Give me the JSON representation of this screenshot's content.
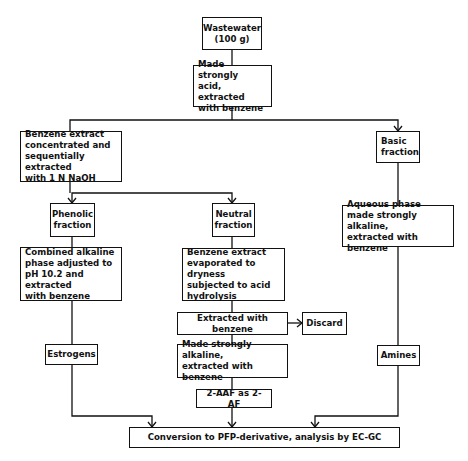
{
  "diagram": {
    "type": "flowchart",
    "nodes": {
      "wastewater": "Wastewater\n(100 g)",
      "acidify": "  Made strongly\nacid, extracted\nwith benzene",
      "benzene_extract": "   Benzene extract\nconcentrated and\nsequentially extracted\nwith 1 N NaOH",
      "basic": "Basic\nfraction",
      "phenolic": "Phenolic\nfraction",
      "neutral": "Neutral\nfraction",
      "combined_alkaline": "   Combined alkaline\nphase adjusted to\npH 10.2 and extracted\nwith benzene",
      "benzene_evaporated": "   Benzene extract\nevaporated to dryness\nsubjected to acid\nhydrolysis",
      "aqueous": "   Aqueous phase\nmade strongly alkaline,\nextracted with benzene",
      "extracted_benzene": "Extracted with benzene",
      "discard": "Discard",
      "made_alkaline": "   Made strongly alkaline,\nextracted with benzene",
      "estrogens": "Estrogens",
      "aaf": "2-AAF as 2-AF",
      "amines": "Amines",
      "conversion": "Conversion to PFP-derivative, analysis by EC-GC"
    },
    "edges": [
      [
        "wastewater",
        "acidify"
      ],
      [
        "acidify",
        "benzene_extract"
      ],
      [
        "acidify",
        "basic"
      ],
      [
        "benzene_extract",
        "phenolic"
      ],
      [
        "benzene_extract",
        "neutral"
      ],
      [
        "phenolic",
        "combined_alkaline"
      ],
      [
        "neutral",
        "benzene_evaporated"
      ],
      [
        "basic",
        "aqueous"
      ],
      [
        "combined_alkaline",
        "estrogens"
      ],
      [
        "benzene_evaporated",
        "extracted_benzene"
      ],
      [
        "extracted_benzene",
        "discard"
      ],
      [
        "extracted_benzene",
        "made_alkaline"
      ],
      [
        "made_alkaline",
        "aaf"
      ],
      [
        "aqueous",
        "amines"
      ],
      [
        "estrogens",
        "conversion"
      ],
      [
        "aaf",
        "conversion"
      ],
      [
        "amines",
        "conversion"
      ]
    ]
  }
}
